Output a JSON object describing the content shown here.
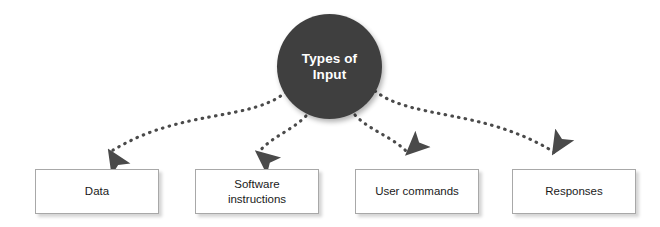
{
  "diagram": {
    "title": "Types of Input",
    "hub": {
      "label_line_1": "Types of",
      "label_line_2": "Input",
      "fill_color": "#3f3f3f",
      "text_color": "#ffffff",
      "shape": "circle"
    },
    "background_color": "#ffffff",
    "connector": {
      "style": "dotted",
      "color": "#4a4a4a",
      "arrowhead": "filled-triangle",
      "count": 4
    },
    "nodes": [
      {
        "id": "data",
        "label": "Data",
        "label_lines": [
          "Data"
        ],
        "shape": "rectangle",
        "fill_color": "#ffffff",
        "border_color": "#a8a8a8"
      },
      {
        "id": "software-instructions",
        "label": "Software instructions",
        "label_lines": [
          "Software",
          "instructions"
        ],
        "shape": "rectangle",
        "fill_color": "#ffffff",
        "border_color": "#a8a8a8"
      },
      {
        "id": "user-commands",
        "label": "User commands",
        "label_lines": [
          "User commands"
        ],
        "shape": "rectangle",
        "fill_color": "#ffffff",
        "border_color": "#a8a8a8"
      },
      {
        "id": "responses",
        "label": "Responses",
        "label_lines": [
          "Responses"
        ],
        "shape": "rectangle",
        "fill_color": "#ffffff",
        "border_color": "#a8a8a8"
      }
    ]
  }
}
